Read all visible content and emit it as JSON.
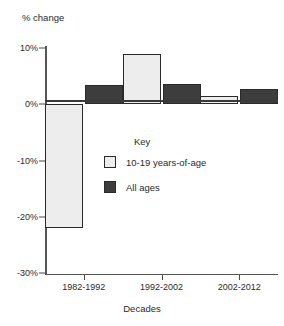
{
  "chart_data": {
    "type": "bar",
    "title": "",
    "xlabel": "Decades",
    "ylabel": "% change",
    "categories": [
      "1982-1992",
      "1992-2002",
      "2002-2012"
    ],
    "series": [
      {
        "name": "10-19 years-of-age",
        "values": [
          -22,
          9,
          1.4
        ],
        "color": "#ededed"
      },
      {
        "name": "All ages",
        "values": [
          3.4,
          3.6,
          2.8
        ],
        "color": "#3d3d3d"
      }
    ],
    "ylim": [
      -30,
      10
    ],
    "yticks": [
      10,
      0,
      -10,
      -20,
      -30
    ],
    "ytick_labels": [
      "10%",
      "0%",
      "-10%",
      "-20%",
      "-30%"
    ],
    "grid": false,
    "legend": {
      "title": "Key",
      "position": "inside-center",
      "entries": [
        {
          "label": "10-19 years-of-age",
          "swatch": "light"
        },
        {
          "label": "All ages",
          "swatch": "dark"
        }
      ]
    }
  }
}
